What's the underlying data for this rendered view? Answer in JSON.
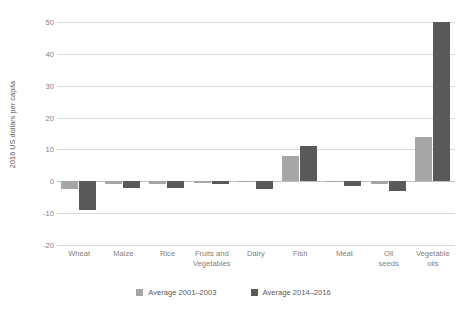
{
  "chart_data": {
    "type": "bar",
    "title": "",
    "xlabel": "",
    "ylabel": "2016 US dollars per capita",
    "ylim": [
      -20,
      50
    ],
    "ytick_step": 10,
    "yticks": [
      50,
      40,
      30,
      20,
      10,
      0,
      -10,
      -20
    ],
    "ytick_labels": [
      "50",
      "40",
      "30",
      "20",
      "10",
      "0",
      "-10",
      "-20"
    ],
    "grid": true,
    "legend_position": "bottom",
    "categories": [
      "Wheat",
      "Maize",
      "Rice",
      "Fruits and Vegetables",
      "Dairy",
      "Fish",
      "Meat",
      "Oil seeds",
      "Vegetable oils"
    ],
    "category_lines": [
      [
        "Wheat"
      ],
      [
        "Maize"
      ],
      [
        "Rice"
      ],
      [
        "Fruits and",
        "Vegetables"
      ],
      [
        "Dairy"
      ],
      [
        "Fish"
      ],
      [
        "Meat"
      ],
      [
        "Oil",
        "seeds"
      ],
      [
        "Vegetable",
        "oils"
      ]
    ],
    "series": [
      {
        "name": "Average 2001–2003",
        "color": "#a6a6a6",
        "values": [
          -2.5,
          -0.7,
          -1.0,
          -0.4,
          -0.3,
          8.0,
          -0.2,
          -1.0,
          14.0
        ]
      },
      {
        "name": "Average 2014–2016",
        "color": "#595959",
        "values": [
          -9.0,
          -2.2,
          -2.0,
          -1.0,
          -2.5,
          11.0,
          -1.5,
          -3.0,
          50.0
        ]
      }
    ]
  },
  "legend": {
    "items": [
      {
        "label": "Average 2001–2003",
        "color": "#a6a6a6"
      },
      {
        "label": "Average 2014–2016",
        "color": "#595959"
      }
    ]
  },
  "colors": {
    "series_light": "#a6a6a6",
    "series_dark": "#595959",
    "gridline": "#d9d9d9",
    "zero_line": "#bfbfbf",
    "text": "#595959",
    "tick_text": "#808080",
    "background": "#ffffff"
  }
}
